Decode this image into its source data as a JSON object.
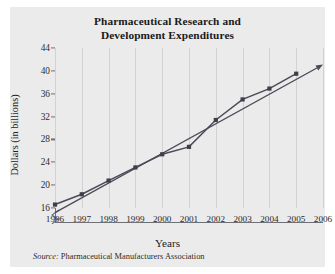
{
  "figure": {
    "title_line_1": "Pharmaceutical Research and",
    "title_line_2": "Development Expenditures",
    "source_label": "Source:",
    "source_text": " Pharmaceutical Manufacturers Association",
    "background_color": "#ebebeb",
    "line_color": "#4b4b58",
    "axis_color": "#6f6f78",
    "grid_color": "#d2d2d2"
  },
  "chart_data": {
    "type": "line",
    "title": "Pharmaceutical Research and Development Expenditures",
    "xlabel": "Years",
    "ylabel": "Dollars (in billions)",
    "x": [
      1996,
      1997,
      1998,
      1999,
      2000,
      2001,
      2002,
      2003,
      2004,
      2005
    ],
    "xtick_labels": [
      "1996",
      "1997",
      "1998",
      "1999",
      "2000",
      "2001",
      "2002",
      "2003",
      "2004",
      "2005",
      "2006"
    ],
    "ytick_labels": [
      "16",
      "20",
      "24",
      "28",
      "32",
      "36",
      "40",
      "44"
    ],
    "xlim": [
      1996,
      2006
    ],
    "ylim": [
      16,
      44
    ],
    "grid": "vertical",
    "legend": "none",
    "axis_break_y": true,
    "series": [
      {
        "name": "R&D Expenditures",
        "marker": "square",
        "values": [
          16.6,
          18.4,
          20.8,
          23.1,
          25.4,
          26.7,
          31.4,
          35.0,
          36.9,
          39.5
        ]
      },
      {
        "name": "Trend line",
        "marker": "arrow",
        "x": [
          1996,
          2006
        ],
        "values": [
          15.2,
          41.1
        ]
      }
    ]
  }
}
